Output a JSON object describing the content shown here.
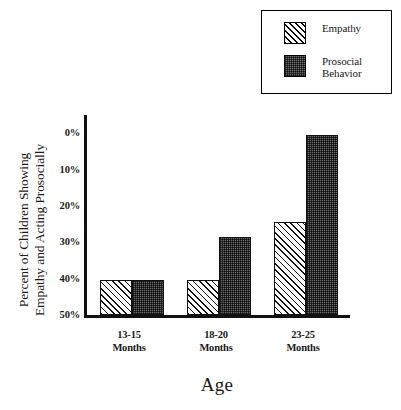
{
  "chart_data": {
    "type": "bar",
    "title": "",
    "xlabel": "Age",
    "ylabel": "Percent of Children Showing\nEmpathy and Acting Prosocially",
    "categories": [
      "13-15\nMonths",
      "18-20\nMonths",
      "23-25\nMonths"
    ],
    "ytick_labels": [
      "0%",
      "10%",
      "20%",
      "30%",
      "40%",
      "50%"
    ],
    "ytick_values": [
      0,
      10,
      20,
      30,
      40,
      50
    ],
    "ylim": [
      0,
      55
    ],
    "grid": false,
    "legend_position": "top-right",
    "series": [
      {
        "name": "Empathy",
        "fill": "diagonal-hatch",
        "color": "#ffffff",
        "values": [
          9.5,
          9.5,
          25.5
        ]
      },
      {
        "name": "Prosocial\nBehavior",
        "fill": "dark-stipple",
        "color": "#676767",
        "values": [
          9.5,
          21.5,
          49.5
        ]
      }
    ]
  },
  "legend": {
    "entries": [
      {
        "label": "Empathy",
        "swatch": "hatched-swatch"
      },
      {
        "label": "Prosocial\nBehavior",
        "swatch": "dark-swatch"
      }
    ]
  },
  "axes": {
    "y_title": "Percent of Children Showing\nEmpathy and Acting Prosocially",
    "x_title": "Age"
  }
}
